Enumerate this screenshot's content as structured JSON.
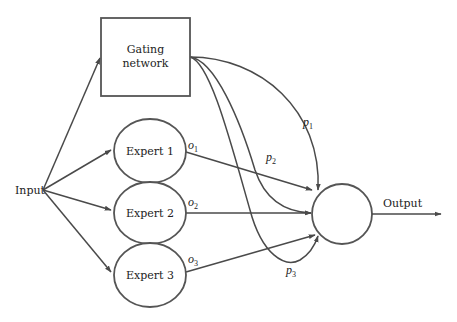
{
  "diagram": {
    "type": "mixture-of-experts",
    "colors": {
      "line": "#4a4a4a",
      "background": "#ffffff"
    },
    "input": {
      "label": "Input"
    },
    "gating": {
      "line1": "Gating",
      "line2": "network"
    },
    "experts": [
      {
        "label": "Expert 1",
        "output_var": "o",
        "output_sub": "1"
      },
      {
        "label": "Expert 2",
        "output_var": "o",
        "output_sub": "2"
      },
      {
        "label": "Expert 3",
        "output_var": "o",
        "output_sub": "3"
      }
    ],
    "gates": [
      {
        "var": "p",
        "sub": "1"
      },
      {
        "var": "p",
        "sub": "2"
      },
      {
        "var": "p",
        "sub": "3"
      }
    ],
    "combiner": {
      "label": ""
    },
    "output": {
      "label": "Output"
    }
  }
}
